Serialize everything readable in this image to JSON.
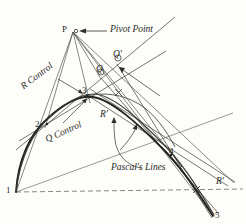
{
  "figure": {
    "type": "geometric-construction-diagram",
    "background_color": "#fdfdf9",
    "ink_color": "#2a2a28",
    "annotations": {
      "pivot_point": "Pivot Point",
      "r_control": "R Control",
      "q_control": "Q Control",
      "pascals_lines": "Pascal's Lines"
    },
    "point_labels": {
      "p": "P",
      "one": "1",
      "two": "2",
      "three": "3",
      "four": "4",
      "five": "5",
      "q": "Q",
      "q_prime": "Q'",
      "r_prime_mid": "R'",
      "r_prime_right": "R'",
      "x_mark_upper": "x",
      "x_mark_lower": "x"
    },
    "points": {
      "P": [
        73,
        32
      ],
      "1": [
        16,
        192
      ],
      "2": [
        45,
        128
      ],
      "3": [
        86,
        95
      ],
      "4": [
        173,
        155
      ],
      "5": [
        213,
        216
      ],
      "Q": [
        101,
        76
      ],
      "Q_prime": [
        117,
        62
      ],
      "R_prime_mid": [
        105,
        117
      ],
      "R_prime_right": [
        222,
        185
      ]
    }
  }
}
